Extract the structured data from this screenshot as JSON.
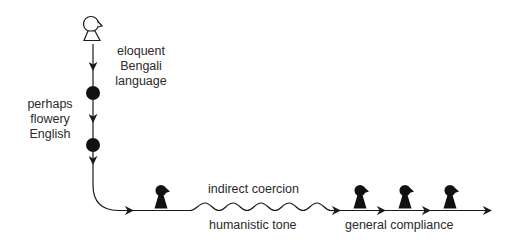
{
  "diagram": {
    "type": "flow-path",
    "start_figure": "speaker-outline-figure",
    "labels": {
      "eloquent_bengali": [
        "eloquent",
        "Bengali",
        "language"
      ],
      "perhaps_flowery": [
        "perhaps",
        "flowery",
        "English"
      ],
      "indirect_coercion": "indirect coercion",
      "humanistic_tone": "humanistic tone",
      "general_compliance": "general compliance"
    },
    "nodes": [
      {
        "kind": "outline-figure",
        "label": "speaker"
      },
      {
        "kind": "filled-dot"
      },
      {
        "kind": "filled-dot"
      },
      {
        "kind": "dark-figure"
      },
      {
        "kind": "dark-figure"
      },
      {
        "kind": "dark-figure"
      },
      {
        "kind": "dark-figure"
      }
    ],
    "colors": {
      "stroke": "#1a1a1a",
      "fill": "#111111",
      "text": "#2a2a2a",
      "background": "#ffffff"
    }
  }
}
